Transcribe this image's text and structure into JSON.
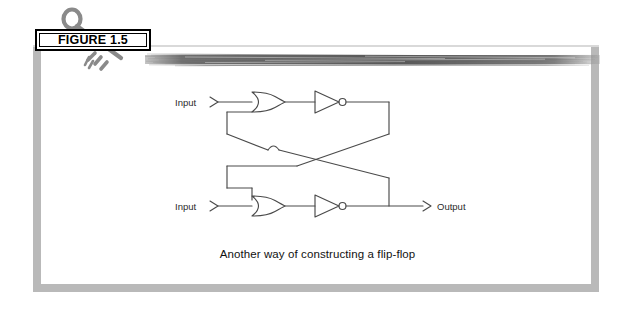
{
  "figure": {
    "label": "FIGURE 1.5",
    "caption": "Another way of constructing a flip-flop",
    "key_icon": "key-icon"
  },
  "colors": {
    "frame": "#b9b9b9",
    "page_background": "#ffffff",
    "ink": "#3a3a3a",
    "label_border": "#000000",
    "streak": "#6e6e6e"
  },
  "diagram": {
    "type": "logic-circuit",
    "title": "Another way of constructing a flip-flop",
    "labels": {
      "input_top": "Input",
      "input_bottom": "Input",
      "output": "Output"
    },
    "gates": [
      {
        "id": "or-top",
        "type": "OR",
        "row": "top"
      },
      {
        "id": "not-top",
        "type": "NOT",
        "row": "top"
      },
      {
        "id": "or-bottom",
        "type": "OR",
        "row": "bottom"
      },
      {
        "id": "not-bottom",
        "type": "NOT",
        "row": "bottom"
      }
    ],
    "connections": [
      {
        "from": "input_top",
        "to": "or-top"
      },
      {
        "from": "or-top",
        "to": "not-top"
      },
      {
        "from": "not-top",
        "to": "or-bottom"
      },
      {
        "from": "input_bottom",
        "to": "or-bottom"
      },
      {
        "from": "or-bottom",
        "to": "not-bottom"
      },
      {
        "from": "not-bottom",
        "to": "or-top"
      },
      {
        "from": "not-bottom",
        "to": "output"
      }
    ],
    "wire_crossing": {
      "style": "hop",
      "count": 1
    }
  }
}
